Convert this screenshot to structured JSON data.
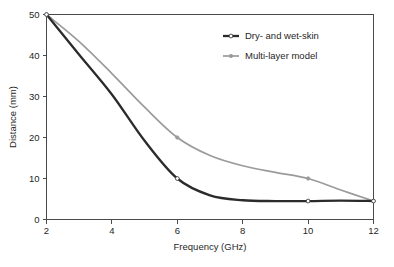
{
  "chart_data": {
    "type": "line",
    "title": "",
    "xlabel": "Frequency (GHz)",
    "ylabel": "Distance (mm)",
    "xlim": [
      2,
      12
    ],
    "ylim": [
      0,
      50
    ],
    "xticks": [
      2,
      4,
      6,
      8,
      10,
      12
    ],
    "yticks": [
      0,
      10,
      20,
      30,
      40,
      50
    ],
    "xtick_labels": [
      "2",
      "4",
      "6",
      "8",
      "10",
      "12"
    ],
    "ytick_labels": [
      "0",
      "10",
      "20",
      "30",
      "40",
      "50"
    ],
    "grid": false,
    "legend_position": "top-right",
    "series": [
      {
        "name": "Dry- and wet-skin",
        "color": "#2b2b2b",
        "line_width": 2.3,
        "marker": "circle",
        "x": [
          2,
          3,
          4,
          5,
          6,
          7,
          8,
          9,
          10,
          11,
          12
        ],
        "values": [
          50,
          40.2,
          30.5,
          19.2,
          10,
          5.9,
          4.7,
          4.5,
          4.5,
          4.6,
          4.5
        ],
        "marker_x": [
          2,
          6,
          10,
          12
        ],
        "marker_values": [
          50,
          10,
          4.5,
          4.5
        ]
      },
      {
        "name": "Multi-layer model",
        "color": "#9b9b9b",
        "line_width": 1.7,
        "marker": "circle",
        "x": [
          2,
          3,
          4,
          5,
          6,
          7,
          8,
          9,
          10,
          11,
          12
        ],
        "values": [
          50,
          43.4,
          35.6,
          27.4,
          20,
          15.6,
          13.1,
          11.5,
          10,
          7.2,
          4.5
        ],
        "marker_x": [
          2,
          6,
          10,
          12
        ],
        "marker_values": [
          50,
          20,
          10,
          4.5
        ]
      }
    ]
  },
  "legend": {
    "entries": [
      {
        "label": "Dry- and wet-skin"
      },
      {
        "label": "Multi-layer model"
      }
    ]
  },
  "axes": {
    "x_title": "Frequency (GHz)",
    "y_title": "Distance (mm)"
  },
  "caption": {
    "fragment": ""
  }
}
